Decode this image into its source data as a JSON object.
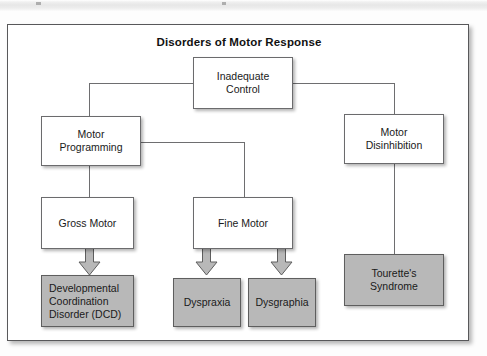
{
  "figure": {
    "title": "Disorders of Motor Response",
    "colors": {
      "frame_border": "#58585a",
      "node_border": "#6b6b6d",
      "node_fill": "#ffffff",
      "shaded_fill": "#b8b8b8",
      "connector": "#6e6e70",
      "arrow_fill": "#b8b8b8",
      "text": "#1a1a1a"
    },
    "nodes": [
      {
        "id": "inadequate-control",
        "label": "Inadequate\nControl",
        "shaded": false,
        "align": "center"
      },
      {
        "id": "motor-programming",
        "label": "Motor\nProgramming",
        "shaded": false,
        "align": "center"
      },
      {
        "id": "motor-disinhibition",
        "label": "Motor\nDisinhibition",
        "shaded": false,
        "align": "center"
      },
      {
        "id": "gross-motor",
        "label": "Gross Motor",
        "shaded": false,
        "align": "center"
      },
      {
        "id": "fine-motor",
        "label": "Fine Motor",
        "shaded": false,
        "align": "center"
      },
      {
        "id": "dcd",
        "label": "Developmental\nCoordination\nDisorder (DCD)",
        "shaded": true,
        "align": "left"
      },
      {
        "id": "dyspraxia",
        "label": "Dyspraxia",
        "shaded": true,
        "align": "center"
      },
      {
        "id": "dysgraphia",
        "label": "Dysgraphia",
        "shaded": true,
        "align": "center"
      },
      {
        "id": "tourettes",
        "label": "Tourette's\nSyndrome",
        "shaded": true,
        "align": "center"
      }
    ],
    "edges": [
      {
        "from": "inadequate-control",
        "to": "motor-programming",
        "style": "line"
      },
      {
        "from": "inadequate-control",
        "to": "motor-disinhibition",
        "style": "line"
      },
      {
        "from": "motor-programming",
        "to": "gross-motor",
        "style": "line"
      },
      {
        "from": "motor-programming",
        "to": "fine-motor",
        "style": "line"
      },
      {
        "from": "motor-disinhibition",
        "to": "tourettes",
        "style": "line"
      },
      {
        "from": "gross-motor",
        "to": "dcd",
        "style": "block-arrow"
      },
      {
        "from": "fine-motor",
        "to": "dyspraxia",
        "style": "block-arrow"
      },
      {
        "from": "fine-motor",
        "to": "dysgraphia",
        "style": "block-arrow"
      }
    ]
  }
}
